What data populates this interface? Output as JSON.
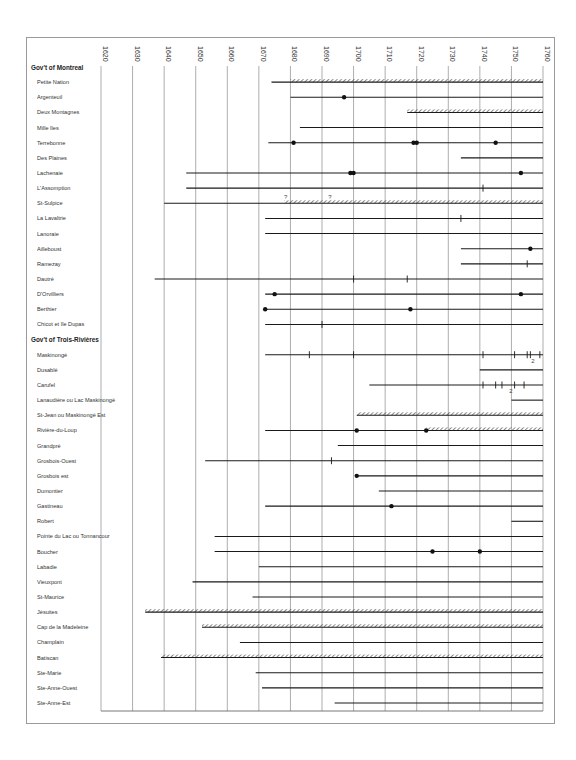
{
  "chart_data": {
    "type": "timeline",
    "title": "",
    "xlabel": "",
    "ylabel": "",
    "xlim": [
      1620,
      1760
    ],
    "x_ticks": [
      1620,
      1630,
      1640,
      1650,
      1660,
      1670,
      1680,
      1690,
      1700,
      1710,
      1720,
      1730,
      1740,
      1750,
      1760
    ],
    "grid": true,
    "legend": "none",
    "marker_legend": {
      "line": "seigneury in existence",
      "hatched": "hatched segment",
      "dot": "event (dot)",
      "tick": "event (tick)",
      "?": "uncertain",
      "2": "two events"
    },
    "groups": [
      {
        "name": "Gov't of Montreal",
        "rows": [
          {
            "name": "Petite Nation",
            "start": 1674,
            "hatched": [
              [
                1680,
                1760
              ]
            ],
            "dots": [],
            "ticks": []
          },
          {
            "name": "Argenteuil",
            "start": 1680,
            "hatched": [],
            "dots": [
              1697
            ],
            "ticks": []
          },
          {
            "name": "Deux Montagnes",
            "start": 1717,
            "hatched": [
              [
                1717,
                1760
              ]
            ],
            "dots": [],
            "ticks": []
          },
          {
            "name": "Mille Iles",
            "start": 1683,
            "hatched": [],
            "dots": [],
            "ticks": []
          },
          {
            "name": "Terrebonne",
            "start": 1673,
            "hatched": [],
            "dots": [
              1681,
              1719,
              1720,
              1745
            ],
            "ticks": []
          },
          {
            "name": "Des Plaines",
            "start": 1734,
            "hatched": [],
            "dots": [],
            "ticks": []
          },
          {
            "name": "Lachenaie",
            "start": 1647,
            "hatched": [],
            "dots": [
              1699,
              1700,
              1753
            ],
            "ticks": []
          },
          {
            "name": "L'Assomption",
            "start": 1647,
            "hatched": [],
            "dots": [],
            "ticks": [
              1741
            ]
          },
          {
            "name": "St-Sulpice",
            "start": 1640,
            "hatched": [
              [
                1678,
                1760
              ]
            ],
            "dots": [],
            "ticks": [],
            "notes": [
              {
                "x": 1678,
                "text": "?"
              },
              {
                "x": 1692,
                "text": "?"
              }
            ]
          },
          {
            "name": "La Lavaltrie",
            "start": 1672,
            "hatched": [],
            "dots": [],
            "ticks": [
              1734
            ]
          },
          {
            "name": "Lanoraie",
            "start": 1672,
            "hatched": [],
            "dots": [],
            "ticks": []
          },
          {
            "name": "Ailleboust",
            "start": 1734,
            "hatched": [],
            "dots": [
              1756
            ],
            "ticks": []
          },
          {
            "name": "Ramezay",
            "start": 1734,
            "hatched": [],
            "dots": [],
            "ticks": [
              1755
            ]
          },
          {
            "name": "Dautré",
            "start": 1637,
            "hatched": [],
            "dots": [],
            "ticks": [
              1700,
              1717
            ]
          },
          {
            "name": "D'Orvilliers",
            "start": 1672,
            "hatched": [],
            "dots": [
              1675,
              1753
            ],
            "ticks": []
          },
          {
            "name": "Berthier",
            "start": 1672,
            "hatched": [],
            "dots": [
              1672,
              1718
            ],
            "ticks": []
          },
          {
            "name": "Chicot et île Dupas",
            "start": 1672,
            "hatched": [],
            "dots": [],
            "ticks": [
              1690
            ]
          }
        ]
      },
      {
        "name": "Gov't of Trois-Rivières",
        "rows": [
          {
            "name": "Maskinongé",
            "start": 1672,
            "hatched": [],
            "dots": [],
            "ticks": [
              1686,
              1700,
              1741,
              1751,
              1755,
              1756,
              1759
            ],
            "notes": [
              {
                "x": 1756,
                "text": "2"
              }
            ]
          },
          {
            "name": "Dusablé",
            "start": 1740,
            "hatched": [],
            "dots": [],
            "ticks": []
          },
          {
            "name": "Carufel",
            "start": 1705,
            "hatched": [],
            "dots": [],
            "ticks": [
              1741,
              1745,
              1747,
              1751,
              1754
            ],
            "notes": [
              {
                "x": 1749,
                "text": "2"
              }
            ]
          },
          {
            "name": "Lanaudière ou Lac Maskinongé",
            "start": 1750,
            "hatched": [],
            "dots": [],
            "ticks": []
          },
          {
            "name": "St-Jean ou Maskinongé Est",
            "start": 1701,
            "hatched": [
              [
                1701,
                1760
              ]
            ],
            "dots": [],
            "ticks": []
          },
          {
            "name": "Rivière-du-Loup",
            "start": 1672,
            "hatched": [
              [
                1723,
                1760
              ]
            ],
            "dots": [
              1701,
              1723
            ],
            "ticks": []
          },
          {
            "name": "Grandpré",
            "start": 1695,
            "hatched": [],
            "dots": [],
            "ticks": []
          },
          {
            "name": "Grosbois-Ouest",
            "start": 1653,
            "hatched": [],
            "dots": [],
            "ticks": [
              1693
            ]
          },
          {
            "name": "Grosbois est",
            "start": 1701,
            "hatched": [],
            "dots": [
              1701
            ],
            "ticks": []
          },
          {
            "name": "Dumontier",
            "start": 1708,
            "hatched": [],
            "dots": [],
            "ticks": []
          },
          {
            "name": "Gastineau",
            "start": 1672,
            "hatched": [],
            "dots": [
              1712
            ],
            "ticks": []
          },
          {
            "name": "Robert",
            "start": 1750,
            "hatched": [],
            "dots": [],
            "ticks": []
          },
          {
            "name": "Pointe du Lac ou Tonnancour",
            "start": 1656,
            "hatched": [],
            "dots": [],
            "ticks": []
          },
          {
            "name": "Boucher",
            "start": 1656,
            "hatched": [],
            "dots": [
              1725,
              1740
            ],
            "ticks": []
          },
          {
            "name": "Labadie",
            "start": 1670,
            "hatched": [],
            "dots": [],
            "ticks": []
          },
          {
            "name": "Vieuxpont",
            "start": 1649,
            "hatched": [],
            "dots": [],
            "ticks": []
          },
          {
            "name": "St-Maurice",
            "start": 1668,
            "hatched": [],
            "dots": [],
            "ticks": []
          },
          {
            "name": "Jésuites",
            "start": 1634,
            "hatched": [
              [
                1634,
                1760
              ]
            ],
            "dots": [],
            "ticks": []
          },
          {
            "name": "Cap de la Madeleine",
            "start": 1652,
            "hatched": [
              [
                1652,
                1760
              ]
            ],
            "dots": [],
            "ticks": []
          },
          {
            "name": "Champlain",
            "start": 1664,
            "hatched": [],
            "dots": [],
            "ticks": []
          },
          {
            "name": "Batiscan",
            "start": 1639,
            "hatched": [
              [
                1639,
                1760
              ]
            ],
            "dots": [],
            "ticks": []
          },
          {
            "name": "Ste-Marie",
            "start": 1669,
            "hatched": [],
            "dots": [],
            "ticks": []
          },
          {
            "name": "Ste-Anne-Ouest",
            "start": 1671,
            "hatched": [],
            "dots": [],
            "ticks": []
          },
          {
            "name": "Ste-Anne-Est",
            "start": 1694,
            "hatched": [],
            "dots": [],
            "ticks": []
          }
        ]
      }
    ]
  },
  "colors": {
    "line": "#1a1a1a",
    "grid": "#8a8a8a",
    "frame": "#9a9a9a",
    "text": "#333333"
  }
}
